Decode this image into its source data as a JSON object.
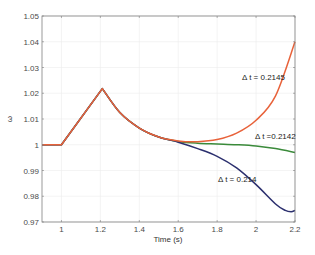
{
  "chart_data": {
    "type": "line",
    "title": "",
    "xlabel": "Time (s)",
    "ylabel": "ω",
    "xlim": [
      0.9,
      2.2
    ],
    "ylim": [
      0.97,
      1.05
    ],
    "grid": true,
    "x_ticks": [
      "1",
      "1.2",
      "1.4",
      "1.6",
      "1.8",
      "2",
      "2.2"
    ],
    "y_ticks": [
      "0.97",
      "0.98",
      "0.99",
      "1",
      "1.01",
      "1.02",
      "1.03",
      "1.04",
      "1.05"
    ],
    "series": [
      {
        "name": "Δt = 0.2145",
        "color": "#e8623a",
        "x": [
          0.9,
          1.0,
          1.21,
          1.3,
          1.4,
          1.5,
          1.6,
          1.7,
          1.8,
          1.9,
          2.0,
          2.1,
          2.2
        ],
        "y": [
          1.0,
          1.0,
          1.0218,
          1.0125,
          1.0065,
          1.003,
          1.0015,
          1.0012,
          1.002,
          1.0045,
          1.0095,
          1.019,
          1.04
        ]
      },
      {
        "name": "Δt = 0.2142",
        "color": "#3a8a3a",
        "x": [
          0.9,
          1.0,
          1.21,
          1.3,
          1.4,
          1.5,
          1.6,
          1.7,
          1.8,
          1.9,
          2.0,
          2.1,
          2.2
        ],
        "y": [
          1.0,
          1.0,
          1.0218,
          1.0125,
          1.0065,
          1.003,
          1.0013,
          1.0006,
          1.0003,
          1.0,
          0.9995,
          0.9985,
          0.997
        ]
      },
      {
        "name": "Δt = 0.214",
        "color": "#2b2f6e",
        "x": [
          0.9,
          1.0,
          1.21,
          1.3,
          1.4,
          1.5,
          1.6,
          1.7,
          1.8,
          1.9,
          2.0,
          2.1,
          2.15,
          2.18,
          2.2
        ],
        "y": [
          1.0,
          1.0,
          1.0218,
          1.0125,
          1.0065,
          1.003,
          1.001,
          0.9985,
          0.9955,
          0.991,
          0.9845,
          0.977,
          0.9745,
          0.974,
          0.9745
        ]
      }
    ],
    "annotations": [
      {
        "text": "Δ t = 0.2145",
        "x": 2.03,
        "y": 1.025
      },
      {
        "text": "Δ t =0.2142",
        "x": 2.05,
        "y": 1.0015
      },
      {
        "text": "Δ t = 0.214",
        "x": 1.88,
        "y": 0.9885
      }
    ]
  },
  "labels": {
    "xlabel": "Time (s)",
    "ylabel": "ω",
    "ann1": "Δ t = 0.2145",
    "ann2": "Δ t =0.2142",
    "ann3": "Δ t = 0.214"
  }
}
